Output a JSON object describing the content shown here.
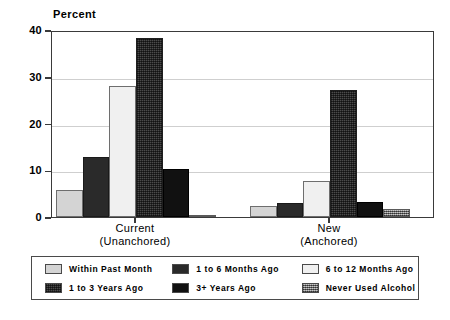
{
  "chart_data": {
    "type": "bar",
    "title": "",
    "ylabel": "Percent",
    "xlabel": "",
    "ylim": [
      0,
      40
    ],
    "yticks": [
      0,
      10,
      20,
      30,
      40
    ],
    "ytick_labels": [
      "0",
      "10",
      "20",
      "30",
      "40"
    ],
    "grid": true,
    "legend_position": "below",
    "categories": [
      "Current\n(Unanchored)",
      "New\n(Anchored)"
    ],
    "category_lines": [
      {
        "line1": "Current",
        "line2": "(Unanchored)"
      },
      {
        "line1": "New",
        "line2": "(Anchored)"
      }
    ],
    "series": [
      {
        "name": "Within Past Month",
        "values": [
          5.7,
          2.3
        ],
        "swatch": "light-gray-solid"
      },
      {
        "name": "1 to 6 Months Ago",
        "values": [
          12.8,
          3.0
        ],
        "swatch": "very-dark-solid"
      },
      {
        "name": "6 to 12 Months Ago",
        "values": [
          28.0,
          7.8
        ],
        "swatch": "white-solid"
      },
      {
        "name": "1 to 3 Years Ago",
        "values": [
          38.3,
          27.2
        ],
        "swatch": "dark-speckle"
      },
      {
        "name": "3+ Years Ago",
        "values": [
          10.2,
          3.3
        ],
        "swatch": "black-solid"
      },
      {
        "name": "Never Used Alcohol",
        "values": [
          0.5,
          1.8
        ],
        "swatch": "gray-checker"
      }
    ]
  },
  "axis": {
    "y_title": "Percent"
  },
  "legend": {
    "items": [
      {
        "label": "Within Past Month"
      },
      {
        "label": "1 to 6 Months Ago"
      },
      {
        "label": "6 to 12 Months Ago"
      },
      {
        "label": "1 to 3 Years Ago"
      },
      {
        "label": "3+ Years Ago"
      },
      {
        "label": "Never Used Alcohol"
      }
    ]
  },
  "colors": {
    "axis": "#3a3a3a",
    "grid": "#cfcfcf",
    "text": "#000000",
    "background": "#ffffff"
  }
}
